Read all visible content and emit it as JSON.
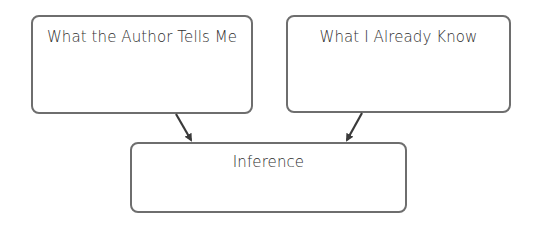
{
  "diagram": {
    "boxes": [
      {
        "id": "author",
        "label": "What the Author Tells Me"
      },
      {
        "id": "know",
        "label": "What I Already Know"
      },
      {
        "id": "inference",
        "label": "Inference"
      }
    ],
    "edges": [
      {
        "from": "author",
        "to": "inference"
      },
      {
        "from": "know",
        "to": "inference"
      }
    ],
    "colors": {
      "border": "#6e6e6e",
      "arrow": "#3a3a3a",
      "text": "#2e2e2e"
    }
  }
}
